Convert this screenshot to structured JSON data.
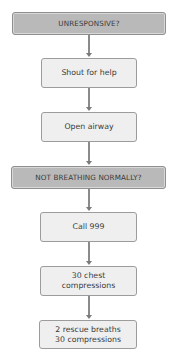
{
  "diagram": {
    "type": "flowchart",
    "direction": "top-to-bottom",
    "colors": {
      "question_fill": "#b9b9b9",
      "step_fill": "#efefef",
      "border": "#9c9c9c",
      "connector": "#8a8a8a",
      "text": "#3a3a3a"
    },
    "nodes": [
      {
        "id": "n1",
        "kind": "question",
        "label": "UNRESPONSIVE?"
      },
      {
        "id": "n2",
        "kind": "step",
        "label": "Shout for help"
      },
      {
        "id": "n3",
        "kind": "step",
        "label": "Open airway"
      },
      {
        "id": "n4",
        "kind": "question",
        "label": "NOT BREATHING NORMALLY?"
      },
      {
        "id": "n5",
        "kind": "step",
        "label": "Call 999"
      },
      {
        "id": "n6",
        "kind": "step",
        "label": "30 chest\ncompressions"
      },
      {
        "id": "n7",
        "kind": "step",
        "label": "2 rescue breaths\n30 compressions"
      }
    ],
    "edges": [
      {
        "from": "n1",
        "to": "n2"
      },
      {
        "from": "n2",
        "to": "n3"
      },
      {
        "from": "n3",
        "to": "n4"
      },
      {
        "from": "n4",
        "to": "n5"
      },
      {
        "from": "n5",
        "to": "n6"
      },
      {
        "from": "n6",
        "to": "n7"
      }
    ]
  }
}
